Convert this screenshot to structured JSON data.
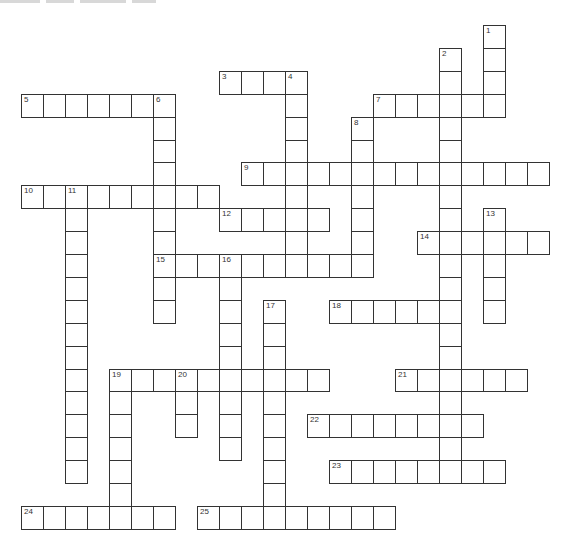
{
  "puzzle": {
    "grid_origin": {
      "x": 21,
      "y": 25
    },
    "cell_size": {
      "w": 22,
      "h": 22.9
    },
    "border_color": "#333333",
    "words": [
      {
        "number": "1",
        "dir": "down",
        "col": 21,
        "row": 0,
        "length": 4
      },
      {
        "number": "2",
        "dir": "down",
        "col": 19,
        "row": 1,
        "length": 18
      },
      {
        "number": "3",
        "dir": "across",
        "col": 9,
        "row": 2,
        "length": 4
      },
      {
        "number": "4",
        "dir": "down",
        "col": 12,
        "row": 2,
        "length": 9
      },
      {
        "number": "5",
        "dir": "across",
        "col": 0,
        "row": 3,
        "length": 7
      },
      {
        "number": "6",
        "dir": "down",
        "col": 6,
        "row": 3,
        "length": 10
      },
      {
        "number": "7",
        "dir": "across",
        "col": 16,
        "row": 3,
        "length": 6
      },
      {
        "number": "8",
        "dir": "down",
        "col": 15,
        "row": 4,
        "length": 7
      },
      {
        "number": "9",
        "dir": "across",
        "col": 10,
        "row": 6,
        "length": 14
      },
      {
        "number": "10",
        "dir": "across",
        "col": 0,
        "row": 7,
        "length": 9
      },
      {
        "number": "11",
        "dir": "down",
        "col": 2,
        "row": 7,
        "length": 13
      },
      {
        "number": "12",
        "dir": "across",
        "col": 9,
        "row": 8,
        "length": 5
      },
      {
        "number": "13",
        "dir": "down",
        "col": 21,
        "row": 8,
        "length": 5
      },
      {
        "number": "14",
        "dir": "across",
        "col": 18,
        "row": 9,
        "length": 6
      },
      {
        "number": "15",
        "dir": "across",
        "col": 6,
        "row": 10,
        "length": 10
      },
      {
        "number": "16",
        "dir": "down",
        "col": 9,
        "row": 10,
        "length": 9
      },
      {
        "number": "17",
        "dir": "down",
        "col": 11,
        "row": 12,
        "length": 10
      },
      {
        "number": "18",
        "dir": "across",
        "col": 14,
        "row": 12,
        "length": 6
      },
      {
        "number": "19",
        "dir": "across",
        "col": 4,
        "row": 15,
        "length": 10
      },
      {
        "number": "19",
        "dir": "down",
        "col": 4,
        "row": 15,
        "length": 6
      },
      {
        "number": "20",
        "dir": "down",
        "col": 7,
        "row": 15,
        "length": 3
      },
      {
        "number": "21",
        "dir": "across",
        "col": 17,
        "row": 15,
        "length": 6
      },
      {
        "number": "22",
        "dir": "across",
        "col": 13,
        "row": 17,
        "length": 8
      },
      {
        "number": "23",
        "dir": "across",
        "col": 14,
        "row": 19,
        "length": 8
      },
      {
        "number": "24",
        "dir": "across",
        "col": 0,
        "row": 21,
        "length": 7
      },
      {
        "number": "25",
        "dir": "across",
        "col": 8,
        "row": 21,
        "length": 9
      }
    ]
  }
}
